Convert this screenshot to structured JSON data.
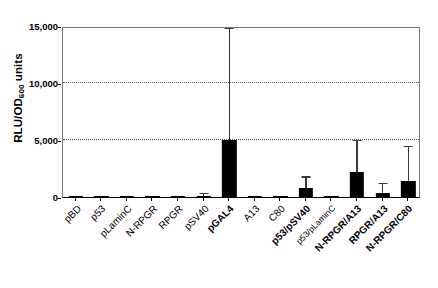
{
  "chart_data": {
    "type": "bar",
    "title": "",
    "xlabel": "",
    "ylabel": "RLU/OD600 units",
    "ylabel_base": "RLU/OD",
    "ylabel_sub": "600",
    "ylabel_suffix": " units",
    "ylim": [
      0,
      15000
    ],
    "yticks": [
      0,
      5000,
      10000,
      15000
    ],
    "ytick_labels": [
      "0",
      "5,000",
      "10,000",
      "15,000"
    ],
    "grid": "horizontal-dotted",
    "legend": "none",
    "bar_color": "#000000",
    "error_color": "#3a3a3a",
    "categories": [
      "pBD",
      "p53",
      "pLaminC",
      "N-RPGR",
      "RPGR",
      "pSV40",
      "pGAL4",
      "A13",
      "C80",
      "p53/pSV40",
      "p53/pLaminC",
      "N-RPGR/A13",
      "RPGR/A13",
      "N-RPGR/C80"
    ],
    "category_styles": [
      "normal",
      "normal",
      "normal",
      "normal",
      "normal",
      "normal",
      "bold",
      "normal",
      "normal",
      "bold",
      "small",
      "bold",
      "bold",
      "bold"
    ],
    "values": [
      20,
      90,
      70,
      90,
      110,
      120,
      5000,
      90,
      100,
      760,
      110,
      2200,
      380,
      1380
    ],
    "errors_upper": [
      0,
      0,
      0,
      0,
      0,
      160,
      9700,
      0,
      0,
      930,
      0,
      2720,
      740,
      2970
    ]
  }
}
